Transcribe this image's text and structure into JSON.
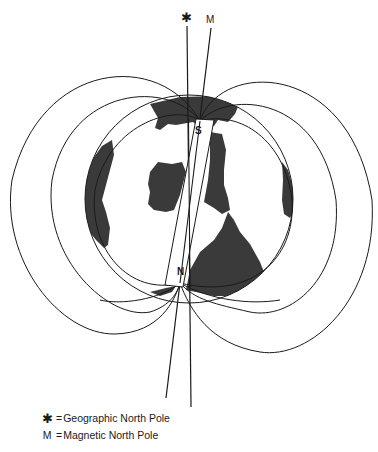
{
  "diagram": {
    "type": "earth-magnetic-field",
    "top_labels": {
      "geographic_symbol": "✱",
      "magnetic_symbol": "M"
    },
    "magnet": {
      "top_pole_label": "S",
      "bottom_pole_label": "N"
    },
    "colors": {
      "line": "#1a1a1a",
      "land": "#3a3a3a",
      "background": "#ffffff"
    }
  },
  "legend": {
    "items": [
      {
        "symbol": "✱",
        "equals": "=",
        "text": "Geographic North Pole"
      },
      {
        "symbol": "M",
        "equals": "=",
        "text": "Magnetic North Pole"
      }
    ]
  }
}
